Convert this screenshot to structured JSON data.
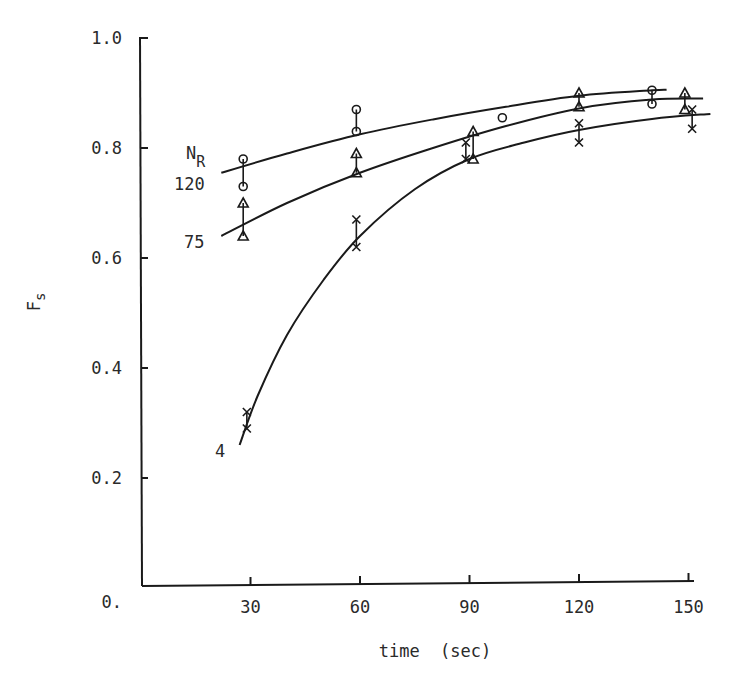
{
  "chart_data": {
    "type": "scatter",
    "title": "",
    "xlabel": "time  (sec)",
    "ylabel": "F",
    "ylabel_subscript": "s",
    "xlim": [
      0,
      155
    ],
    "ylim": [
      0,
      1.0
    ],
    "x_ticks": [
      30,
      60,
      90,
      120,
      150
    ],
    "x_tick_labels": [
      "30",
      "60",
      "90",
      "120",
      "150"
    ],
    "y_ticks": [
      0,
      0.2,
      0.4,
      0.6,
      0.8,
      1.0
    ],
    "y_tick_labels": [
      "0.",
      "0.2",
      "0.4",
      "0.6",
      "0.8",
      "1.0"
    ],
    "grid": false,
    "legend_title": "N",
    "legend_title_subscript": "R",
    "series": [
      {
        "name": "120",
        "marker": "circle",
        "points": [
          {
            "x": 28,
            "y_low": 0.73,
            "y_high": 0.78
          },
          {
            "x": 59,
            "y_low": 0.83,
            "y_high": 0.87
          },
          {
            "x": 99,
            "y": 0.855
          },
          {
            "x": 140,
            "y_low": 0.88,
            "y_high": 0.905
          }
        ],
        "fit_curve": [
          [
            22,
            0.755
          ],
          [
            40,
            0.79
          ],
          [
            60,
            0.825
          ],
          [
            80,
            0.852
          ],
          [
            100,
            0.875
          ],
          [
            120,
            0.895
          ],
          [
            140,
            0.905
          ],
          [
            144,
            0.906
          ]
        ]
      },
      {
        "name": "75",
        "marker": "triangle",
        "points": [
          {
            "x": 28,
            "y_low": 0.64,
            "y_high": 0.7
          },
          {
            "x": 59,
            "y_low": 0.755,
            "y_high": 0.79
          },
          {
            "x": 91,
            "y_low": 0.78,
            "y_high": 0.83
          },
          {
            "x": 120,
            "y_low": 0.875,
            "y_high": 0.9
          },
          {
            "x": 149,
            "y_low": 0.87,
            "y_high": 0.9
          }
        ],
        "fit_curve": [
          [
            22,
            0.64
          ],
          [
            40,
            0.7
          ],
          [
            60,
            0.755
          ],
          [
            80,
            0.8
          ],
          [
            100,
            0.84
          ],
          [
            120,
            0.872
          ],
          [
            140,
            0.888
          ],
          [
            154,
            0.89
          ]
        ]
      },
      {
        "name": "4",
        "marker": "x",
        "points": [
          {
            "x": 29,
            "y_low": 0.29,
            "y_high": 0.32
          },
          {
            "x": 59,
            "y_low": 0.62,
            "y_high": 0.67
          },
          {
            "x": 89,
            "y_low": 0.78,
            "y_high": 0.81
          },
          {
            "x": 120,
            "y_low": 0.81,
            "y_high": 0.845
          },
          {
            "x": 151,
            "y_low": 0.835,
            "y_high": 0.87
          }
        ],
        "fit_curve": [
          [
            27,
            0.26
          ],
          [
            32,
            0.35
          ],
          [
            40,
            0.46
          ],
          [
            50,
            0.56
          ],
          [
            60,
            0.64
          ],
          [
            75,
            0.725
          ],
          [
            90,
            0.78
          ],
          [
            105,
            0.81
          ],
          [
            120,
            0.833
          ],
          [
            140,
            0.853
          ],
          [
            156,
            0.862
          ]
        ]
      }
    ]
  }
}
